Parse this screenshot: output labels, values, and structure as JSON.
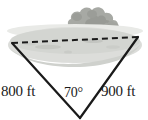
{
  "figure": {
    "background_color": "#ffffff",
    "line_color": "#1a1a1a",
    "water_color": "#d8d9d6",
    "water_shade_color": "#c3c5c1",
    "shore_color": "#e6e7e4",
    "bush_color": "#a7a9a4",
    "bush_shade_color": "#969893"
  },
  "labels": {
    "left_side": "800 ft",
    "right_side": "900 ft",
    "angle": "70°"
  },
  "scene": {
    "water_name": "lake",
    "vegetation_name": "trees-bushes",
    "dashed_line_name": "unknown-distance-across-lake"
  },
  "geometry": {
    "left_vertex": [
      12,
      43
    ],
    "right_vertex": [
      138,
      37
    ],
    "bottom_vertex": [
      80,
      118
    ]
  }
}
